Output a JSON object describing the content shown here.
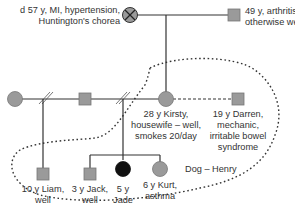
{
  "colors": {
    "symbol_fill": "#9a9a9a",
    "affected_fill": "#111111",
    "line": "#333333",
    "text": "#333333"
  },
  "legend_notes": {
    "deceased_marker": "X",
    "divorce_marker": "//",
    "household_boundary": "dotted"
  },
  "people": {
    "grandmother": {
      "sex": "female",
      "status": "deceased",
      "label_line1": "d 57 y, MI, hypertension,",
      "label_line2": "Huntington's chorea"
    },
    "grandfather": {
      "sex": "male",
      "label_line1": "49 y, arthritis in left hip –",
      "label_line2": "otherwise well"
    },
    "ex_partner_of_father": {
      "sex": "female"
    },
    "father": {
      "sex": "male"
    },
    "kirsty": {
      "sex": "female",
      "label_line1": "28 y Kirsty,",
      "label_line2": "housewife – well,",
      "label_line3": "smokes 20/day"
    },
    "darren": {
      "sex": "male",
      "label_line1": "19 y Darren,",
      "label_line2": "mechanic,",
      "label_line3": "irritable bowel",
      "label_line4": "syndrome"
    },
    "liam": {
      "sex": "male",
      "label_line1": "10 y Liam,",
      "label_line2": "well"
    },
    "jack": {
      "sex": "male",
      "label_line1": "3 y Jack,",
      "label_line2": "well"
    },
    "jade": {
      "sex": "female",
      "status": "affected",
      "label_line1": "5 y",
      "label_line2": "Jade"
    },
    "kurt": {
      "sex": "female-symbol",
      "label_line1": "6 y Kurt,",
      "label_line2": "asthma"
    }
  },
  "household_note": "Dog – Henry"
}
